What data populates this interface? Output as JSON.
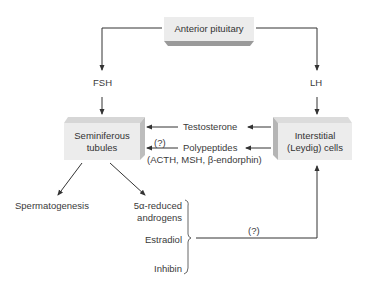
{
  "diagram": {
    "nodes": {
      "anterior_pituitary": "Anterior pituitary",
      "seminiferous_line1": "Seminiferous",
      "seminiferous_line2": "tubules",
      "interstitial_line1": "Interstitial",
      "interstitial_line2": "(Leydig) cells"
    },
    "labels": {
      "fsh": "FSH",
      "lh": "LH",
      "testosterone": "Testosterone",
      "polypeptides": "Polypeptides",
      "polypeptides_uncertain": "(?)",
      "polypeptides_detail": "(ACTH, MSH, β-endorphin)",
      "spermatogenesis": "Spermatogenesis",
      "reduced_androgens_line1": "5α-reduced",
      "reduced_androgens_line2": "androgens",
      "estradiol": "Estradiol",
      "inhibin": "Inhibin",
      "feedback_uncertain": "(?)"
    },
    "edges": [
      {
        "from": "Anterior pituitary",
        "to": "Seminiferous tubules",
        "label": "FSH"
      },
      {
        "from": "Anterior pituitary",
        "to": "Interstitial (Leydig) cells",
        "label": "LH"
      },
      {
        "from": "Interstitial (Leydig) cells",
        "to": "Seminiferous tubules",
        "label": "Testosterone"
      },
      {
        "from": "Interstitial (Leydig) cells",
        "to": "Seminiferous tubules",
        "label": "Polypeptides (?)"
      },
      {
        "from": "Seminiferous tubules",
        "to": "Spermatogenesis"
      },
      {
        "from": "Seminiferous tubules",
        "to": "5α-reduced androgens"
      },
      {
        "from": "5α-reduced androgens / Estradiol / Inhibin",
        "to": "Interstitial (Leydig) cells",
        "label": "(?)"
      }
    ],
    "colors": {
      "box_face": "#ececec",
      "box_side": "#bdbdbd",
      "line": "#333333"
    }
  }
}
